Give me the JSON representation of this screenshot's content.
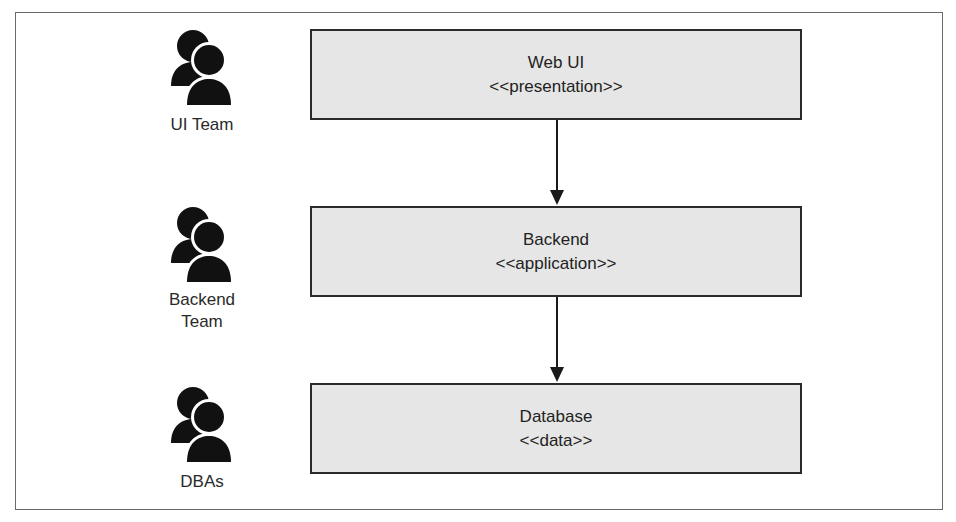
{
  "layers": [
    {
      "name": "Web UI",
      "stereotype": "<<presentation>>"
    },
    {
      "name": "Backend",
      "stereotype": "<<application>>"
    },
    {
      "name": "Database",
      "stereotype": "<<data>>"
    }
  ],
  "teams": [
    {
      "label": "UI Team",
      "icon": "people-icon"
    },
    {
      "label": "Backend\nTeam",
      "label_line1": "Backend",
      "label_line2": "Team",
      "icon": "people-icon"
    },
    {
      "label": "DBAs",
      "icon": "people-icon"
    }
  ],
  "connections": [
    {
      "from": "Web UI",
      "to": "Backend"
    },
    {
      "from": "Backend",
      "to": "Database"
    }
  ],
  "colors": {
    "box_fill": "#e6e6e6",
    "stroke": "#2a2a2a",
    "frame": "#6a6a6a"
  }
}
